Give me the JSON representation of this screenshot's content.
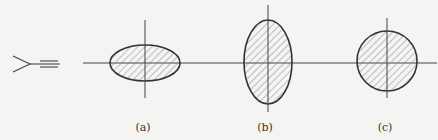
{
  "figure": {
    "labels": [
      "(a)",
      "(b)",
      "(c)"
    ],
    "eye_symbol": "viewing-eye-icon",
    "shapes": [
      {
        "id": "a",
        "type": "horizontal-ellipse",
        "cx": 145,
        "cy": 63,
        "rx": 35,
        "ry": 18
      },
      {
        "id": "b",
        "type": "vertical-ellipse",
        "cx": 268,
        "cy": 62,
        "rx": 24,
        "ry": 42
      },
      {
        "id": "c",
        "type": "circle",
        "cx": 387,
        "cy": 61,
        "r": 30
      }
    ],
    "colors": {
      "stroke": "#333333",
      "hatch": "#7a7a7a",
      "background": "#f4f4f2"
    }
  }
}
